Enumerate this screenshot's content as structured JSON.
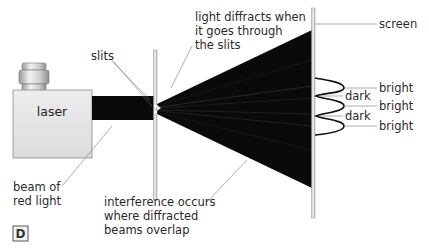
{
  "diagram": {
    "figure_label": "D",
    "labels": {
      "laser": "laser",
      "slits": "slits",
      "diffract_line1": "light diffracts when",
      "diffract_line2": "it goes through",
      "diffract_line3": "the slits",
      "screen": "screen",
      "bright_1": "bright",
      "dark_1": "dark",
      "bright_2": "bright",
      "dark_2": "dark",
      "bright_3": "bright",
      "beam_line1": "beam of",
      "beam_line2": "red light",
      "interference_line1": "interference occurs",
      "interference_line2": "where diffracted",
      "interference_line3": "beams overlap"
    },
    "colors": {
      "beam": "#0a0a0a",
      "laser_body": "#e6e6e6",
      "leader_line": "#777777",
      "screen": "#cfcfcf"
    }
  }
}
